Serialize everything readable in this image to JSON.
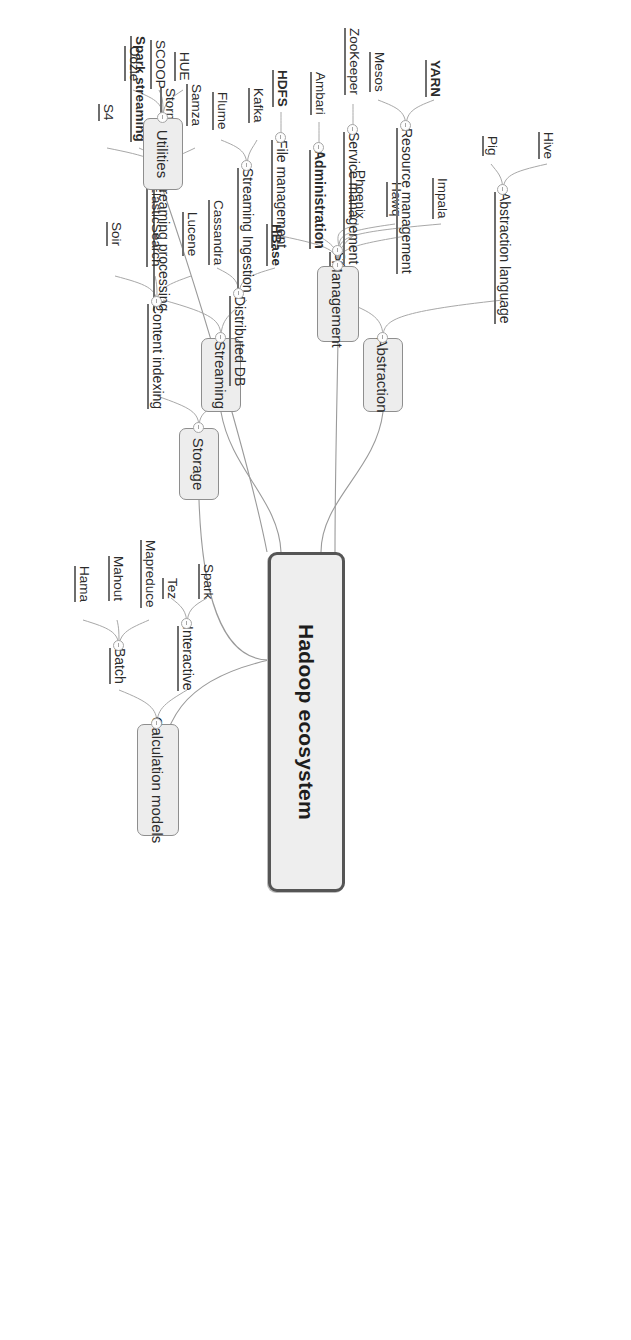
{
  "diagram": {
    "title": "Hadoop ecosystem",
    "type": "mind-map",
    "orientation": "rotated-90-clockwise",
    "colors": {
      "root_fill": "#eeeeee",
      "root_border": "#555555",
      "category_fill": "#ededed",
      "category_border": "#8e8e8e",
      "connector": "#9a9a9a",
      "text": "#2b2b2b",
      "underline": "#6e6e6e"
    }
  },
  "root": {
    "label": "Hadoop ecosystem"
  },
  "branches": [
    {
      "id": "abstraction",
      "label": "Abstraction",
      "subs": [
        {
          "label": "Abstraction language",
          "leaves": [
            {
              "label": "Hive"
            },
            {
              "label": "Pig"
            }
          ]
        },
        {
          "label": "SQL",
          "leaves": [
            {
              "label": "Impala"
            },
            {
              "label": "Hawq"
            },
            {
              "label": "Phoenix"
            }
          ]
        }
      ]
    },
    {
      "id": "streaming",
      "label": "Streaming",
      "subs": [
        {
          "label": "Streaming Ingestion",
          "leaves": [
            {
              "label": "Kafka"
            },
            {
              "label": "Flume"
            }
          ]
        },
        {
          "label": "Streaming processing",
          "leaves": [
            {
              "label": "Samza"
            },
            {
              "label": "Storm"
            },
            {
              "label": "Spark streaming",
              "bold": true
            },
            {
              "label": "S4"
            }
          ]
        }
      ]
    },
    {
      "id": "management",
      "label": "Management",
      "subs": [
        {
          "label": "Resource management",
          "leaves": [
            {
              "label": "YARN",
              "bold": true
            },
            {
              "label": "Mesos"
            }
          ]
        },
        {
          "label": "Service management",
          "leaves": [
            {
              "label": "ZooKeeper"
            }
          ]
        },
        {
          "label": "Administration",
          "bold": true,
          "leaves": [
            {
              "label": "Ambari"
            }
          ]
        },
        {
          "label": "File management",
          "leaves": [
            {
              "label": "HDFS",
              "bold": true
            }
          ]
        }
      ]
    },
    {
      "id": "storage",
      "label": "Storage",
      "subs": [
        {
          "label": "Distributed DB",
          "leaves": [
            {
              "label": "HBase",
              "bold": true
            },
            {
              "label": "Cassandra"
            }
          ]
        },
        {
          "label": "Content indexing",
          "leaves": [
            {
              "label": "Lucene"
            },
            {
              "label": "ElasticSearch"
            },
            {
              "label": "Soir"
            }
          ]
        }
      ]
    },
    {
      "id": "calculation-models",
      "label": "Calculation models",
      "subs": [
        {
          "label": "Interactive",
          "leaves": [
            {
              "label": "Spark"
            },
            {
              "label": "Tez"
            }
          ]
        },
        {
          "label": "Batch",
          "leaves": [
            {
              "label": "Mapreduce"
            },
            {
              "label": "Mahout"
            },
            {
              "label": "Hama"
            }
          ]
        }
      ]
    },
    {
      "id": "utilities",
      "label": "Utilities",
      "subs": [],
      "leaves": [
        {
          "label": "HUE"
        },
        {
          "label": "SCOOP"
        },
        {
          "label": "Oozie"
        }
      ]
    }
  ]
}
